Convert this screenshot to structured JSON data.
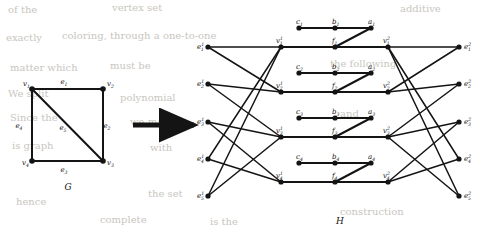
{
  "figure": {
    "caption_left": "G",
    "caption_right": "H",
    "arrow": "right-arrow"
  },
  "graph_g": {
    "vertices": [
      {
        "id": "v1",
        "label": "v",
        "sub": "1",
        "x": 32,
        "y": 89,
        "label_dx": -9,
        "label_dy": -3
      },
      {
        "id": "v2",
        "label": "v",
        "sub": "2",
        "x": 103,
        "y": 89,
        "label_dx": 4,
        "label_dy": -3
      },
      {
        "id": "v3",
        "label": "v",
        "sub": "3",
        "x": 103,
        "y": 161,
        "label_dx": 4,
        "label_dy": 4
      },
      {
        "id": "v4",
        "label": "v",
        "sub": "4",
        "x": 32,
        "y": 161,
        "label_dx": -10,
        "label_dy": 4
      }
    ],
    "edges": [
      {
        "id": "e1",
        "label": "e",
        "sub": "1",
        "from": "v1",
        "to": "v2",
        "label_x": 64,
        "label_y": 84
      },
      {
        "id": "e2",
        "label": "e",
        "sub": "2",
        "from": "v2",
        "to": "v3",
        "label_x": 107,
        "label_y": 128
      },
      {
        "id": "e3",
        "label": "e",
        "sub": "3",
        "from": "v3",
        "to": "v4",
        "label_x": 64,
        "label_y": 172
      },
      {
        "id": "e4",
        "label": "e",
        "sub": "4",
        "from": "v4",
        "to": "v1",
        "label_x": 19,
        "label_y": 128
      },
      {
        "id": "e5",
        "label": "e",
        "sub": "5",
        "from": "v1",
        "to": "v3",
        "label_x": 63,
        "label_y": 130
      }
    ]
  },
  "graph_h": {
    "columns": {
      "e1_x": 208,
      "v1_x": 281,
      "f_x": 335,
      "v2_x": 388,
      "e2_x": 459,
      "c_x": 299,
      "b_x": 335,
      "a_x": 371
    },
    "rows": {
      "main_y": [
        47,
        92,
        137,
        182
      ],
      "gadget_y": [
        28,
        73,
        118,
        163
      ],
      "e_left_y": [
        47,
        84,
        122,
        159,
        196
      ],
      "e_right_y": [
        47,
        84,
        122,
        159,
        196
      ]
    },
    "e_left_vertices": [
      {
        "id": "eL1",
        "label": "e",
        "sup": "1",
        "sub": "1"
      },
      {
        "id": "eL2",
        "label": "e",
        "sup": "1",
        "sub": "2"
      },
      {
        "id": "eL3",
        "label": "e",
        "sup": "1",
        "sub": "3"
      },
      {
        "id": "eL4",
        "label": "e",
        "sup": "1",
        "sub": "4"
      },
      {
        "id": "eL5",
        "label": "e",
        "sup": "1",
        "sub": "5"
      }
    ],
    "e_right_vertices": [
      {
        "id": "eR1",
        "label": "e",
        "sup": "2",
        "sub": "1"
      },
      {
        "id": "eR2",
        "label": "e",
        "sup": "2",
        "sub": "2"
      },
      {
        "id": "eR3",
        "label": "e",
        "sup": "2",
        "sub": "3"
      },
      {
        "id": "eR4",
        "label": "e",
        "sup": "2",
        "sub": "4"
      },
      {
        "id": "eR5",
        "label": "e",
        "sup": "2",
        "sub": "5"
      }
    ],
    "v1_vertices": [
      {
        "id": "vL1",
        "label": "v",
        "sup": "1",
        "sub": "1"
      },
      {
        "id": "vL2",
        "label": "v",
        "sup": "1",
        "sub": "2"
      },
      {
        "id": "vL3",
        "label": "v",
        "sup": "1",
        "sub": "3"
      },
      {
        "id": "vL4",
        "label": "v",
        "sup": "1",
        "sub": "4"
      }
    ],
    "v2_vertices": [
      {
        "id": "vR1",
        "label": "v",
        "sup": "2",
        "sub": "1"
      },
      {
        "id": "vR2",
        "label": "v",
        "sup": "2",
        "sub": "2"
      },
      {
        "id": "vR3",
        "label": "v",
        "sup": "2",
        "sub": "3"
      },
      {
        "id": "vR4",
        "label": "v",
        "sup": "2",
        "sub": "4"
      }
    ],
    "f_vertices": [
      {
        "id": "f1",
        "label": "f",
        "sub": "1"
      },
      {
        "id": "f2",
        "label": "f",
        "sub": "2"
      },
      {
        "id": "f3",
        "label": "f",
        "sub": "3"
      },
      {
        "id": "f4",
        "label": "f",
        "sub": "4"
      }
    ],
    "a_vertices": [
      {
        "id": "a1",
        "label": "a",
        "sub": "1"
      },
      {
        "id": "a2",
        "label": "a",
        "sub": "2"
      },
      {
        "id": "a3",
        "label": "a",
        "sub": "3"
      },
      {
        "id": "a4",
        "label": "a",
        "sub": "4"
      }
    ],
    "b_vertices": [
      {
        "id": "b1",
        "label": "b",
        "sub": "1"
      },
      {
        "id": "b2",
        "label": "b",
        "sub": "2"
      },
      {
        "id": "b3",
        "label": "b",
        "sub": "3"
      },
      {
        "id": "b4",
        "label": "b",
        "sub": "4"
      }
    ],
    "c_vertices": [
      {
        "id": "c1",
        "label": "c",
        "sub": "1"
      },
      {
        "id": "c2",
        "label": "c",
        "sub": "2"
      },
      {
        "id": "c3",
        "label": "c",
        "sub": "3"
      },
      {
        "id": "c4",
        "label": "c",
        "sub": "4"
      }
    ],
    "left_incidences": [
      {
        "edge": 1,
        "verts": [
          1,
          2
        ]
      },
      {
        "edge": 2,
        "verts": [
          2,
          3
        ]
      },
      {
        "edge": 3,
        "verts": [
          3,
          4
        ]
      },
      {
        "edge": 4,
        "verts": [
          1,
          4
        ]
      },
      {
        "edge": 5,
        "verts": [
          1,
          3
        ]
      }
    ],
    "right_incidences": [
      {
        "edge": 1,
        "verts": [
          1,
          2
        ]
      },
      {
        "edge": 2,
        "verts": [
          2,
          3
        ]
      },
      {
        "edge": 3,
        "verts": [
          3,
          4
        ]
      },
      {
        "edge": 4,
        "verts": [
          1,
          4
        ]
      },
      {
        "edge": 5,
        "verts": [
          1,
          3
        ]
      }
    ]
  },
  "background_text": {
    "lines": [
      {
        "text": "of the",
        "x": 8,
        "y": 4
      },
      {
        "text": "vertex set",
        "x": 112,
        "y": 2
      },
      {
        "text": "additive",
        "x": 400,
        "y": 3
      },
      {
        "text": "exactly",
        "x": 6,
        "y": 32
      },
      {
        "text": "coloring, through a one-to-one",
        "x": 62,
        "y": 30
      },
      {
        "text": "matter which",
        "x": 10,
        "y": 62
      },
      {
        "text": "must be",
        "x": 110,
        "y": 60
      },
      {
        "text": "the following",
        "x": 330,
        "y": 58
      },
      {
        "text": "We split",
        "x": 8,
        "y": 88
      },
      {
        "text": "polynomial",
        "x": 120,
        "y": 92
      },
      {
        "text": "Since the",
        "x": 10,
        "y": 112
      },
      {
        "text": "we may",
        "x": 130,
        "y": 116
      },
      {
        "text": "and",
        "x": 340,
        "y": 108
      },
      {
        "text": "is graph",
        "x": 12,
        "y": 140
      },
      {
        "text": "with",
        "x": 150,
        "y": 142
      },
      {
        "text": "the set",
        "x": 148,
        "y": 188
      },
      {
        "text": "hence",
        "x": 16,
        "y": 196
      },
      {
        "text": "is the",
        "x": 210,
        "y": 216
      },
      {
        "text": "complete",
        "x": 100,
        "y": 214
      },
      {
        "text": "construction",
        "x": 340,
        "y": 206
      }
    ]
  }
}
